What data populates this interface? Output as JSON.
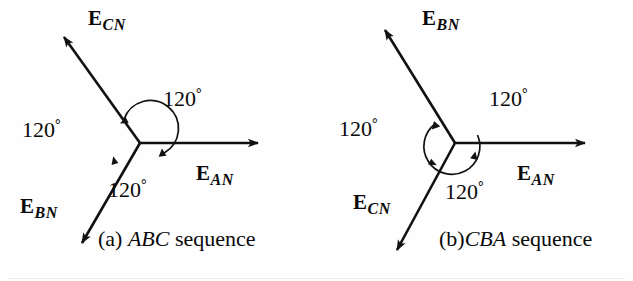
{
  "figure": {
    "stroke_color": "#111111",
    "background": "#fefefe"
  },
  "panels": [
    {
      "id": "abc",
      "caption_prefix": "(a) ",
      "caption_sequence": "ABC",
      "caption_suffix": " sequence",
      "rotation_sense": "counterclockwise",
      "origin": {
        "x": 140,
        "y": 143
      },
      "arc_radius": 28,
      "vectors": [
        {
          "name": "E_AN",
          "label_main": "E",
          "label_sub": "AN",
          "angle_deg": 0,
          "length": 125,
          "label_x": 196,
          "label_y": 163
        },
        {
          "name": "E_CN",
          "label_main": "E",
          "label_sub": "CN",
          "angle_deg": 125,
          "length": 140,
          "label_x": 88,
          "label_y": 8
        },
        {
          "name": "E_BN",
          "label_main": "E",
          "label_sub": "BN",
          "angle_deg": -119,
          "length": 122,
          "label_x": 20,
          "label_y": 196
        }
      ],
      "angles": [
        {
          "name": "angle-top",
          "text": "120",
          "degree_symbol": "°",
          "x": 163,
          "y": 87
        },
        {
          "name": "angle-left",
          "text": "120",
          "degree_symbol": "°",
          "x": 22,
          "y": 118
        },
        {
          "name": "angle-bottom",
          "text": "120",
          "degree_symbol": "°",
          "x": 108,
          "y": 178
        }
      ],
      "caption_x": 98,
      "caption_y": 228
    },
    {
      "id": "cba",
      "caption_prefix": "(b)",
      "caption_sequence": "CBA",
      "caption_suffix": " sequence",
      "rotation_sense": "clockwise",
      "origin": {
        "x": 138,
        "y": 143
      },
      "arc_radius": 28,
      "vectors": [
        {
          "name": "E_AN",
          "label_main": "E",
          "label_sub": "AN",
          "angle_deg": 0,
          "length": 137,
          "label_x": 200,
          "label_y": 163
        },
        {
          "name": "E_BN",
          "label_main": "E",
          "label_sub": "BN",
          "angle_deg": 122,
          "length": 133,
          "label_x": 105,
          "label_y": 8
        },
        {
          "name": "E_CN",
          "label_main": "E",
          "label_sub": "CN",
          "angle_deg": -118,
          "length": 123,
          "label_x": 36,
          "label_y": 192
        }
      ],
      "angles": [
        {
          "name": "angle-top",
          "text": "120",
          "degree_symbol": "°",
          "x": 172,
          "y": 87
        },
        {
          "name": "angle-left",
          "text": "120",
          "degree_symbol": "°",
          "x": 22,
          "y": 117
        },
        {
          "name": "angle-bottom",
          "text": "120",
          "degree_symbol": "°",
          "x": 128,
          "y": 180
        }
      ],
      "caption_x": 122,
      "caption_y": 228
    }
  ]
}
